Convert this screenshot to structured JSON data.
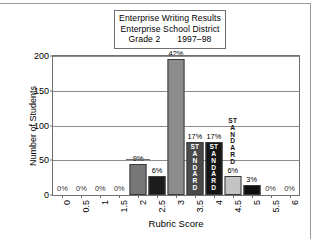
{
  "title_box": {
    "line1": "Enterprise Writing Results",
    "line2": "Enterprise School District",
    "line3_left": "Grade 2",
    "line3_right": "1997–98"
  },
  "chart_data": {
    "type": "bar",
    "xlabel": "Rubric Score",
    "ylabel": "Number of Students",
    "ylim": [
      0,
      200
    ],
    "yticks": [
      0,
      50,
      100,
      150,
      200
    ],
    "grid": true,
    "legend": "none",
    "categories": [
      "0",
      "0.5",
      "1",
      "1.5",
      "2",
      "2.5",
      "3",
      "3.5",
      "4",
      "4.5",
      "5",
      "5.5",
      "6"
    ],
    "values": [
      0,
      0,
      0,
      0,
      45,
      28,
      195,
      76,
      76,
      28,
      14,
      0,
      0
    ],
    "data_labels": [
      "0%",
      "0%",
      "0%",
      "0%",
      "9%",
      "6%",
      "42%",
      "17%",
      "17%",
      "6%",
      "3%",
      "0%",
      "0%"
    ],
    "bar_colors": [
      "none",
      "none",
      "none",
      "none",
      "#777777",
      "#1c1c1c",
      "#8c8c8c",
      "#4a4a4a",
      "#151515",
      "#c3c3c3",
      "#0f0f0f",
      "none",
      "none"
    ],
    "annotations": [
      {
        "text": "STANDARD",
        "category": "3.5",
        "placement": "inside-bar",
        "orientation": "vertical"
      },
      {
        "text": "STANDARD",
        "category": "4",
        "placement": "inside-bar",
        "orientation": "vertical"
      },
      {
        "text": "STANDARD",
        "category": "4.5",
        "placement": "above-bar",
        "orientation": "vertical"
      }
    ]
  }
}
